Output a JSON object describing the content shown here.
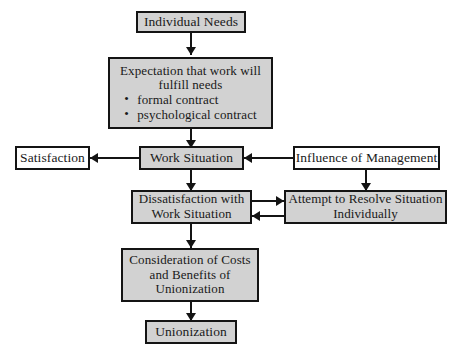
{
  "diagram": {
    "colors": {
      "shaded_fill": "#d2d2d2",
      "plain_fill": "#ffffff",
      "stroke": "#141414",
      "text": "#191919"
    },
    "nodes": {
      "individual_needs": {
        "label": "Individual Needs"
      },
      "expectation": {
        "line1": "Expectation that work will",
        "line2": "fulfill needs",
        "bullet1": "formal contract",
        "bullet2": "psychological contract"
      },
      "satisfaction": {
        "label": "Satisfaction"
      },
      "work_situation": {
        "label": "Work Situation"
      },
      "influence_of_management": {
        "label": "Influence of Management"
      },
      "dissatisfaction": {
        "line1": "Dissatisfaction with",
        "line2": "Work Situation"
      },
      "attempt_resolve": {
        "line1": "Attempt to Resolve Situation",
        "line2": "Individually"
      },
      "consideration": {
        "line1": "Consideration of Costs",
        "line2": "and Benefits of",
        "line3": "Unionization"
      },
      "unionization": {
        "label": "Unionization"
      }
    }
  }
}
